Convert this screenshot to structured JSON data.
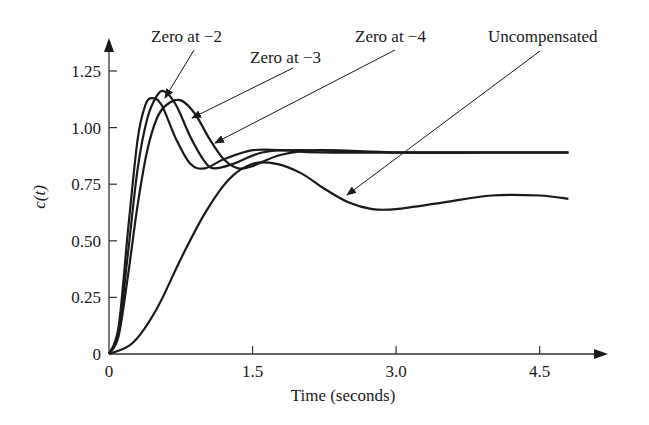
{
  "chart_data": {
    "type": "line",
    "title": "",
    "xlabel": "Time (seconds)",
    "ylabel": "c(t)",
    "xlim": [
      0,
      5.0
    ],
    "ylim": [
      0,
      1.35
    ],
    "grid": false,
    "legend": "callout annotations with arrows",
    "x_ticks": [
      0,
      1.5,
      3.0,
      4.5
    ],
    "x_tick_labels": [
      "0",
      "1.5",
      "3.0",
      "4.5"
    ],
    "y_ticks": [
      0,
      0.25,
      0.5,
      0.75,
      1.0,
      1.25
    ],
    "y_tick_labels": [
      "0",
      "0.25",
      "0.50",
      "0.75",
      "1.00",
      "1.25"
    ],
    "series": [
      {
        "name": "Zero at −4",
        "x": [
          0,
          0.1,
          0.2,
          0.3,
          0.38,
          0.45,
          0.55,
          0.7,
          0.85,
          1.0,
          1.2,
          1.5,
          1.8,
          2.2,
          3.0,
          4.0,
          4.8
        ],
        "y": [
          0,
          0.12,
          0.55,
          0.95,
          1.1,
          1.13,
          1.1,
          0.95,
          0.84,
          0.82,
          0.86,
          0.9,
          0.9,
          0.89,
          0.89,
          0.89,
          0.89
        ]
      },
      {
        "name": "Zero at −3",
        "x": [
          0,
          0.1,
          0.2,
          0.3,
          0.4,
          0.5,
          0.58,
          0.7,
          0.85,
          1.0,
          1.1,
          1.3,
          1.6,
          2.0,
          3.0,
          4.0,
          4.8
        ],
        "y": [
          0,
          0.1,
          0.45,
          0.82,
          1.04,
          1.14,
          1.16,
          1.1,
          0.96,
          0.85,
          0.82,
          0.84,
          0.89,
          0.9,
          0.89,
          0.89,
          0.89
        ]
      },
      {
        "name": "Zero at −2",
        "x": [
          0,
          0.1,
          0.2,
          0.3,
          0.4,
          0.5,
          0.6,
          0.75,
          0.9,
          1.05,
          1.2,
          1.35,
          1.5,
          1.8,
          2.2,
          3.0,
          4.0,
          4.8
        ],
        "y": [
          0,
          0.08,
          0.35,
          0.66,
          0.9,
          1.04,
          1.1,
          1.12,
          1.06,
          0.95,
          0.86,
          0.82,
          0.83,
          0.88,
          0.9,
          0.89,
          0.89,
          0.89
        ]
      },
      {
        "name": "Uncompensated",
        "x": [
          0,
          0.25,
          0.5,
          0.75,
          1.0,
          1.25,
          1.5,
          1.75,
          2.0,
          2.25,
          2.5,
          2.75,
          3.0,
          3.5,
          4.0,
          4.5,
          4.8
        ],
        "y": [
          0,
          0.05,
          0.2,
          0.42,
          0.62,
          0.77,
          0.84,
          0.84,
          0.8,
          0.73,
          0.67,
          0.64,
          0.64,
          0.67,
          0.7,
          0.7,
          0.685
        ]
      }
    ],
    "annotations": [
      {
        "text": "Zero at −2",
        "points_to": "peak of highest curve"
      },
      {
        "text": "Zero at −3",
        "points_to": "descending overshoot"
      },
      {
        "text": "Zero at −4",
        "points_to": "descending overshoot"
      },
      {
        "text": "Uncompensated",
        "points_to": "slow curve near t≈2.5"
      }
    ]
  },
  "labels": {
    "ylabel": "c(t)",
    "xlabel": "Time (seconds)",
    "ann1": "Zero at −2",
    "ann2": "Zero at −3",
    "ann3": "Zero at −4",
    "ann4": "Uncompensated"
  },
  "style": {
    "curve_color": "#1a1a1a",
    "axis_color": "#333333"
  }
}
